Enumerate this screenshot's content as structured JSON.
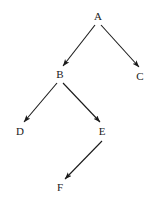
{
  "diagram": {
    "type": "directed-tree",
    "background_color": "#ffffff",
    "stroke_color": "#1a1a1a",
    "label_color": "#1a1a1a",
    "width": 158,
    "height": 205,
    "nodes": [
      {
        "id": "A",
        "label": "A",
        "x": 98,
        "y": 16
      },
      {
        "id": "B",
        "label": "B",
        "x": 60,
        "y": 74
      },
      {
        "id": "C",
        "label": "C",
        "x": 140,
        "y": 76
      },
      {
        "id": "D",
        "label": "D",
        "x": 20,
        "y": 131
      },
      {
        "id": "E",
        "label": "E",
        "x": 102,
        "y": 131
      },
      {
        "id": "F",
        "label": "F",
        "x": 60,
        "y": 187
      }
    ],
    "edges": [
      {
        "id": "A-B",
        "from": "A",
        "to": "B",
        "x1": 95,
        "y1": 25,
        "x2": 63,
        "y2": 66
      },
      {
        "id": "A-C",
        "from": "A",
        "to": "C",
        "x1": 101,
        "y1": 25,
        "x2": 139,
        "y2": 67
      },
      {
        "id": "B-D",
        "from": "B",
        "to": "D",
        "x1": 57,
        "y1": 83,
        "x2": 24,
        "y2": 122
      },
      {
        "id": "B-E",
        "from": "B",
        "to": "E",
        "x1": 63,
        "y1": 83,
        "x2": 100,
        "y2": 122
      },
      {
        "id": "E-F",
        "from": "E",
        "to": "F",
        "x1": 102,
        "y1": 141,
        "x2": 65,
        "y2": 179
      }
    ]
  }
}
